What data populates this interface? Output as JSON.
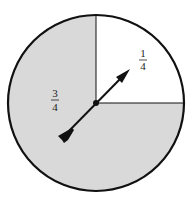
{
  "spinner": {
    "sections": [
      {
        "label_num": "1",
        "label_den": "4",
        "fraction": 0.25,
        "fill": "#ffffff",
        "position": "top-right"
      },
      {
        "label_num": "3",
        "label_den": "4",
        "fraction": 0.75,
        "fill": "#d9d9d9",
        "position": "remaining"
      }
    ],
    "outline_color": "#111111",
    "arrow_color": "#111111",
    "arrow_direction": "pointing toward upper-right section"
  }
}
